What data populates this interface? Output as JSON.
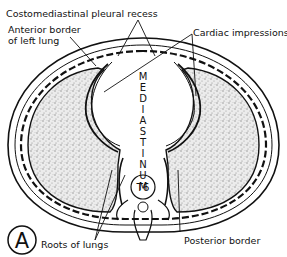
{
  "diagram": {
    "figure_letter": "A",
    "labels": {
      "costomediastinal": "Costomediastinal pleural recess",
      "anterior_border_line1": "Anterior border",
      "anterior_border_line2": "of left lung",
      "cardiac": "Cardiac impressions",
      "mediastinum_letters": [
        "M",
        "E",
        "D",
        "I",
        "A",
        "S",
        "T",
        "I",
        "N",
        "U",
        "M"
      ],
      "vertebra": "T6",
      "roots": "Roots of lungs",
      "posterior": "Posterior border"
    },
    "colors": {
      "ink": "#111111",
      "lung_fill": "#d9d9d9",
      "background": "#ffffff"
    }
  }
}
